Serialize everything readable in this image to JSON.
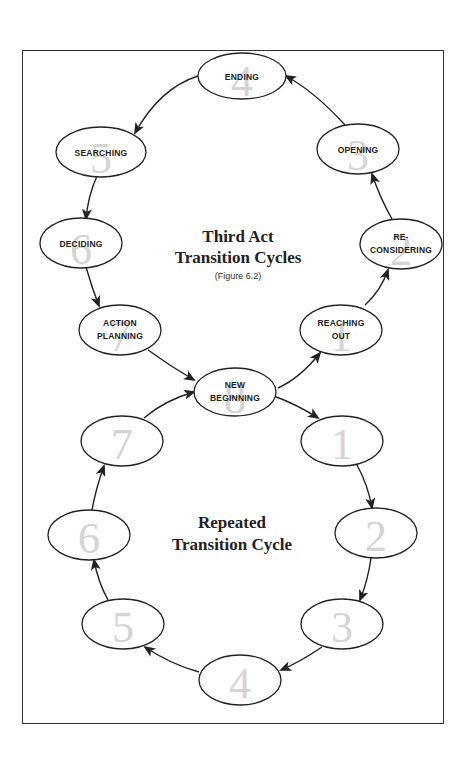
{
  "diagram": {
    "upper_cycle": {
      "title_line1": "Third Act",
      "title_line2": "Transition Cycles",
      "caption": "(Figure 6.2)",
      "nodes": [
        {
          "num": "8",
          "line1": "New",
          "line2": "Beginning"
        },
        {
          "num": "1",
          "line1": "Reaching",
          "line2": "Out"
        },
        {
          "num": "2",
          "line1": "Re-",
          "line2": "considering"
        },
        {
          "num": "3",
          "line1": "Opening",
          "line2": ""
        },
        {
          "num": "4",
          "line1": "Ending",
          "line2": ""
        },
        {
          "num": "5",
          "line1": "Searching",
          "line2": ""
        },
        {
          "num": "6",
          "line1": "Deciding",
          "line2": ""
        },
        {
          "num": "7",
          "line1": "Action",
          "line2": "Planning"
        }
      ]
    },
    "lower_cycle": {
      "title_line1": "Repeated",
      "title_line2": "Transition Cycle",
      "nodes": [
        {
          "num": "1"
        },
        {
          "num": "2"
        },
        {
          "num": "3"
        },
        {
          "num": "4"
        },
        {
          "num": "5"
        },
        {
          "num": "6"
        },
        {
          "num": "7"
        }
      ]
    },
    "colors": {
      "stroke": "#222222",
      "number_watermark": "#d4d4d4",
      "background": "#ffffff"
    }
  }
}
